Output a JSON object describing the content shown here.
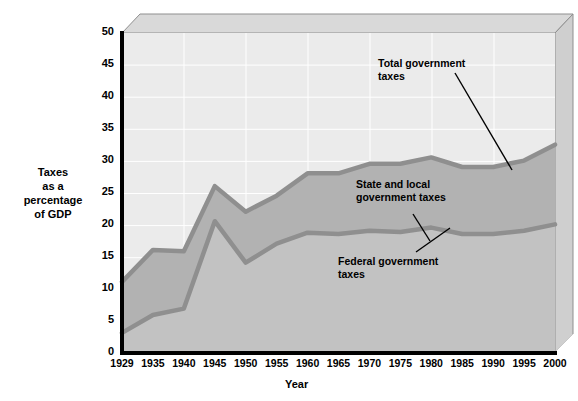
{
  "axes": {
    "y_title": "Taxes\nas a\npercentage\nof GDP",
    "x_title": "Year",
    "y_ticks": [
      "0",
      "5",
      "10",
      "15",
      "20",
      "25",
      "30",
      "35",
      "40",
      "45",
      "50"
    ],
    "x_ticks": [
      "1929",
      "1935",
      "1940",
      "1945",
      "1950",
      "1955",
      "1960",
      "1965",
      "1970",
      "1975",
      "1980",
      "1985",
      "1990",
      "1995",
      "2000"
    ]
  },
  "annotations": {
    "total": "Total government\ntaxes",
    "state_local": "State and local\ngovernment taxes",
    "federal": "Federal government\ntaxes"
  },
  "colors": {
    "band_total_fill": "#ebebeb",
    "band_state_fill": "#b2b2b2",
    "band_federal_fill": "#c2c2c2",
    "line_stroke": "#8a8a8a",
    "axis": "#000000",
    "grid": "#ffffff",
    "frame_top": "#d9d9d9",
    "frame_side": "#c8c8c8"
  },
  "chart_data": {
    "type": "area",
    "title": "",
    "xlabel": "Year",
    "ylabel": "Taxes as a percentage of GDP",
    "ylim": [
      0,
      50
    ],
    "grid": true,
    "legend": "annotations-inline",
    "x": [
      1929,
      1935,
      1940,
      1945,
      1950,
      1955,
      1960,
      1965,
      1970,
      1975,
      1980,
      1985,
      1990,
      1995,
      2000
    ],
    "series": [
      {
        "name": "Total government taxes",
        "values": [
          11.0,
          16.0,
          15.8,
          26.0,
          22.0,
          24.5,
          28.0,
          28.0,
          29.5,
          29.5,
          30.5,
          29.0,
          29.0,
          30.0,
          32.5
        ]
      },
      {
        "name": "Federal government taxes",
        "values": [
          3.0,
          5.8,
          6.8,
          20.5,
          14.0,
          17.0,
          18.7,
          18.5,
          19.0,
          18.8,
          19.5,
          18.5,
          18.5,
          19.0,
          20.0
        ]
      }
    ],
    "derived_series": [
      {
        "name": "State and local government taxes",
        "values": [
          8.0,
          10.2,
          9.0,
          5.5,
          8.0,
          7.5,
          9.3,
          9.5,
          10.5,
          10.7,
          11.0,
          10.5,
          10.5,
          11.0,
          12.5
        ]
      }
    ]
  }
}
